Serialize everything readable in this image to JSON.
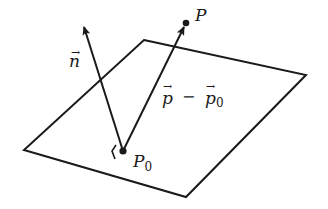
{
  "diagram": {
    "colors": {
      "stroke": "#1a1a1a",
      "background": "#ffffff"
    },
    "plane": {
      "corners": [
        [
          144,
          40
        ],
        [
          306,
          75
        ],
        [
          186,
          197
        ],
        [
          24,
          150
        ]
      ]
    },
    "points": {
      "p0": {
        "x": 123,
        "y": 151,
        "label": "P",
        "subscript": "0"
      },
      "p": {
        "x": 186,
        "y": 23,
        "label": "P"
      }
    },
    "vectors": {
      "normal": {
        "label": "n",
        "arrow": "→",
        "tip": [
          83,
          25
        ]
      },
      "difference": {
        "label_left": "p",
        "minus": "−",
        "label_right": "p",
        "subscript": "0",
        "arrow": "→"
      }
    },
    "right_angle_marker": "⟨"
  }
}
